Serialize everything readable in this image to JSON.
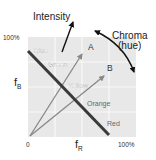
{
  "diagram": {
    "title_intensity": "Intensity",
    "title_chroma_line1": "Chroma",
    "title_chroma_line2": "(hue)",
    "y_axis": {
      "label": "f",
      "subscript": "B",
      "max_label": "100%"
    },
    "x_axis": {
      "label": "f",
      "subscript": "R",
      "min_label": "0",
      "max_label": "100%"
    },
    "color_line_labels": [
      "Blue",
      "Green",
      "Yellow",
      "Orange",
      "Red"
    ],
    "vectors": [
      {
        "name": "A"
      },
      {
        "name": "B"
      }
    ],
    "icons": {
      "intensity_arrow": "arrow-up-right-icon",
      "chroma_arc": "double-headed-curved-arrow-icon"
    },
    "colors": {
      "plot_background": "#e8e8e8",
      "grid_lines": "#f7f7f7",
      "color_line": "#3a3a3a",
      "vectors": "#8a8a8a",
      "text_dark": "#222222",
      "text_light": "#ffffff",
      "text_on_plot": "#666666"
    }
  }
}
